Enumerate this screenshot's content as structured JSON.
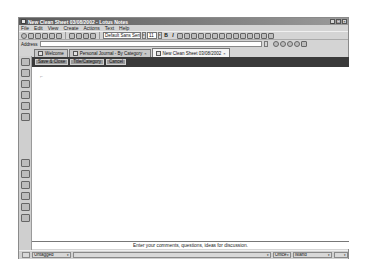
{
  "window": {
    "title": "New Clean Sheet 03/08/2002 - Lotus Notes",
    "controls": [
      "_",
      "□",
      "×"
    ]
  },
  "menu": {
    "items": [
      "File",
      "Edit",
      "View",
      "Create",
      "Actions",
      "Text",
      "Help"
    ]
  },
  "toolbar": {
    "font_name": "Default Sans Serif",
    "font_size": "11",
    "bold_label": "B",
    "italic_label": "I"
  },
  "address": {
    "label": "Address",
    "value": ""
  },
  "tabs": [
    {
      "label": "Welcome",
      "active": false,
      "closable": false
    },
    {
      "label": "Personal Journal - By Category",
      "active": false,
      "closable": true
    },
    {
      "label": "New Clean Sheet 03/08/2002",
      "active": true,
      "closable": true
    }
  ],
  "tab_close_glyph": "×",
  "action_bar": {
    "buttons": [
      "Save & Close",
      "Title/Category",
      "Cancel"
    ]
  },
  "content": {
    "cursor_mark": "⌐"
  },
  "comment_prompt": "Enter your comments, questions, ideas for discussion.",
  "status_bar": {
    "tag_select": "Untagged",
    "location": "Office",
    "last_select": "Island"
  },
  "dropdown_glyph": "▾",
  "colors": {
    "action_bar_bg": "#3a3a3a",
    "title_bar_start": "#5a5a5a",
    "chrome_bg": "#d4d4d4"
  }
}
